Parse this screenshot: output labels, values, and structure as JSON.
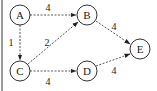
{
  "diagram": {
    "type": "directed-weighted-graph",
    "nodes": [
      {
        "id": "A",
        "label": "A",
        "x": 20,
        "y": 15
      },
      {
        "id": "B",
        "label": "B",
        "x": 87,
        "y": 15
      },
      {
        "id": "C",
        "label": "C",
        "x": 20,
        "y": 71
      },
      {
        "id": "D",
        "label": "D",
        "x": 87,
        "y": 71
      },
      {
        "id": "E",
        "label": "E",
        "x": 140,
        "y": 49
      }
    ],
    "edges": [
      {
        "from": "A",
        "to": "B",
        "weight": "4"
      },
      {
        "from": "A",
        "to": "C",
        "weight": "1"
      },
      {
        "from": "C",
        "to": "B",
        "weight": "2"
      },
      {
        "from": "C",
        "to": "D",
        "weight": "4"
      },
      {
        "from": "B",
        "to": "E",
        "weight": "4"
      },
      {
        "from": "D",
        "to": "E",
        "weight": "4"
      }
    ],
    "edge_style": "dashed-arrow"
  }
}
